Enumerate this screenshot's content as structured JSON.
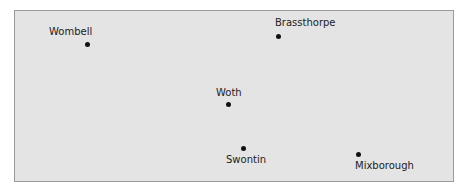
{
  "map": {
    "background": "#e4e4e4",
    "border": "#9a9a9a",
    "places": [
      {
        "name": "Wombell",
        "dot": [
          87,
          44
        ],
        "label": [
          49,
          26
        ]
      },
      {
        "name": "Brassthorpe",
        "dot": [
          278,
          36
        ],
        "label": [
          275,
          18
        ]
      },
      {
        "name": "Woth",
        "dot": [
          228,
          104
        ],
        "label": [
          216,
          86
        ]
      },
      {
        "name": "Swontin",
        "dot": [
          243,
          148
        ],
        "label": [
          226,
          155
        ]
      },
      {
        "name": "Mixborough",
        "dot": [
          358,
          154
        ],
        "label": [
          355,
          160
        ]
      }
    ]
  }
}
